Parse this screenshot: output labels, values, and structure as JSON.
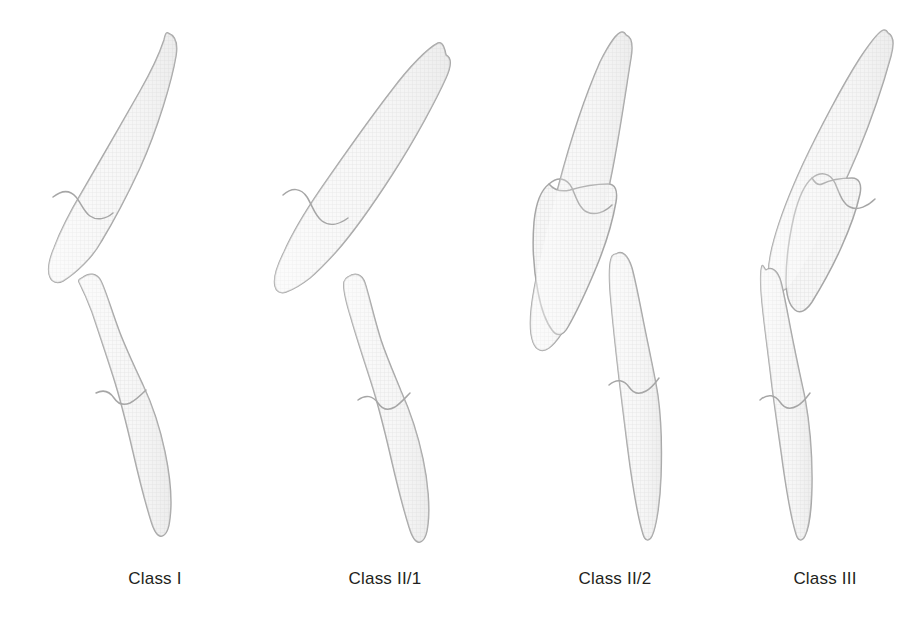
{
  "figure": {
    "background_color": "#ffffff",
    "tooth_fill_color": "#f4f4f4",
    "tooth_outline_color": "#a6a6a6",
    "tooth_hatch_color": "#e2e2e2",
    "label_color": "#231f20"
  },
  "groups": [
    {
      "id": "class-1",
      "label": "Class I",
      "label_center_x": 155,
      "label_y": 583,
      "upper_incisor": {
        "name": "upper-incisor",
        "root_direction": "up-right",
        "crown_direction": "down-left",
        "inclination": "slightly proclined"
      },
      "lower_incisor": {
        "name": "lower-incisor",
        "crown_direction": "up",
        "root_direction": "down",
        "inclination": "upright"
      },
      "relationship": "normal overbite and overjet"
    },
    {
      "id": "class-2-div-1",
      "label": "Class II/1",
      "label_center_x": 385,
      "label_y": 583,
      "upper_incisor": {
        "name": "upper-incisor",
        "root_direction": "up-right",
        "crown_direction": "down-left",
        "inclination": "proclined"
      },
      "lower_incisor": {
        "name": "lower-incisor",
        "crown_direction": "up",
        "root_direction": "down-right",
        "inclination": "retruded"
      },
      "relationship": "increased overjet, proclined upper incisors"
    },
    {
      "id": "class-2-div-2",
      "label": "Class II/2",
      "label_center_x": 615,
      "label_y": 583,
      "upper_incisor": {
        "name": "upper-incisor",
        "root_direction": "up",
        "crown_direction": "down-left",
        "inclination": "retroclined"
      },
      "lower_incisor": {
        "name": "lower-incisor",
        "crown_direction": "up",
        "root_direction": "down",
        "inclination": "upright"
      },
      "relationship": "retroclined upper central incisors, deep overbite"
    },
    {
      "id": "class-3",
      "label": "Class III",
      "label_center_x": 825,
      "label_y": 583,
      "upper_incisor": {
        "name": "upper-incisor",
        "root_direction": "up-right",
        "crown_direction": "down",
        "inclination": "upright"
      },
      "lower_incisor": {
        "name": "lower-incisor",
        "crown_direction": "up",
        "root_direction": "down",
        "inclination": "anterior to upper incisor"
      },
      "relationship": "reverse overjet, lower incisor edge anterior to upper"
    }
  ]
}
